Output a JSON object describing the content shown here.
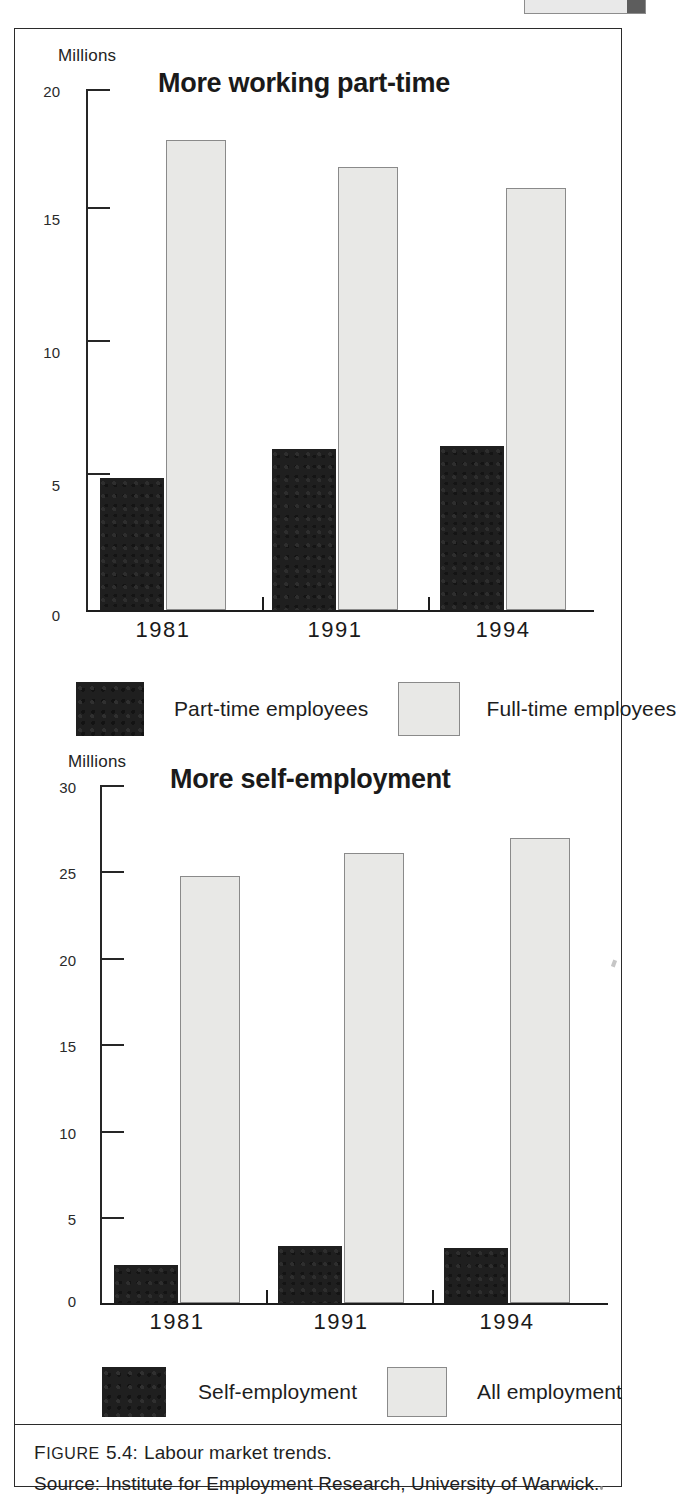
{
  "figure": {
    "caption_prefix": "Figure",
    "caption_number": "5.4:",
    "caption_text": "Labour market trends.",
    "source_line": "Source: Institute for Employment Research, University of Warwick."
  },
  "charts": [
    {
      "id": "part-time",
      "title": "More working part-time",
      "axis_unit_label": "Millions",
      "y_ticks": [
        "20",
        "15",
        "10",
        "5",
        "0"
      ],
      "x_ticks": [
        "1981",
        "1991",
        "1994"
      ],
      "legend": [
        {
          "swatch": "dark",
          "label": "Part-time employees"
        },
        {
          "swatch": "light",
          "label": "Full-time employees"
        }
      ]
    },
    {
      "id": "self-employment",
      "title": "More self-employment",
      "axis_unit_label": "Millions",
      "y_ticks": [
        "30",
        "25",
        "20",
        "15",
        "10",
        "5",
        "0"
      ],
      "x_ticks": [
        "1981",
        "1991",
        "1994"
      ],
      "legend": [
        {
          "swatch": "dark",
          "label": "Self-employment"
        },
        {
          "swatch": "light",
          "label": "All employment"
        }
      ]
    }
  ],
  "chart_data": [
    {
      "type": "bar",
      "title": "More working part-time",
      "xlabel": "",
      "ylabel": "Millions",
      "ylim": [
        0,
        20
      ],
      "yticks": [
        0,
        5,
        10,
        15,
        20
      ],
      "grid": false,
      "legend_position": "below",
      "categories": [
        "1981",
        "1991",
        "1994"
      ],
      "series": [
        {
          "name": "Part-time employees",
          "color": "#1f1f1f",
          "values": [
            5.1,
            6.2,
            6.3
          ]
        },
        {
          "name": "Full-time employees",
          "color": "#e8e8e6",
          "values": [
            17.7,
            16.7,
            15.9
          ]
        }
      ]
    },
    {
      "type": "bar",
      "title": "More self-employment",
      "xlabel": "",
      "ylabel": "Millions",
      "ylim": [
        0,
        30
      ],
      "yticks": [
        0,
        5,
        10,
        15,
        20,
        25,
        30
      ],
      "grid": false,
      "legend_position": "below",
      "categories": [
        "1981",
        "1991",
        "1994"
      ],
      "series": [
        {
          "name": "Self-employment",
          "color": "#1f1f1f",
          "values": [
            2.2,
            3.3,
            3.2
          ]
        },
        {
          "name": "All employment",
          "color": "#e8e8e6",
          "values": [
            24.7,
            26.0,
            26.9
          ]
        }
      ]
    }
  ]
}
